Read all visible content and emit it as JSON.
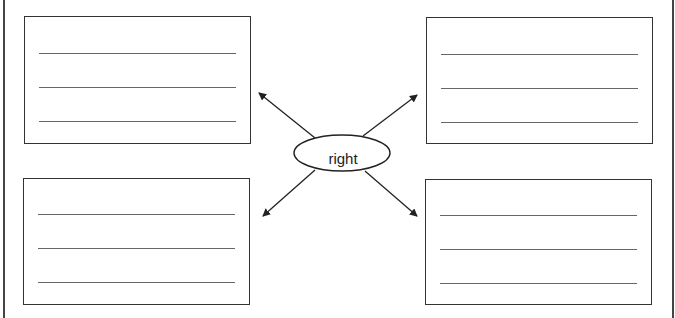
{
  "diagram": {
    "type": "word-web",
    "center": {
      "label": "right"
    },
    "boxes": [
      {
        "position": "top-left",
        "lines": 3
      },
      {
        "position": "top-right",
        "lines": 3
      },
      {
        "position": "bottom-left",
        "lines": 3
      },
      {
        "position": "bottom-right",
        "lines": 3
      }
    ]
  }
}
